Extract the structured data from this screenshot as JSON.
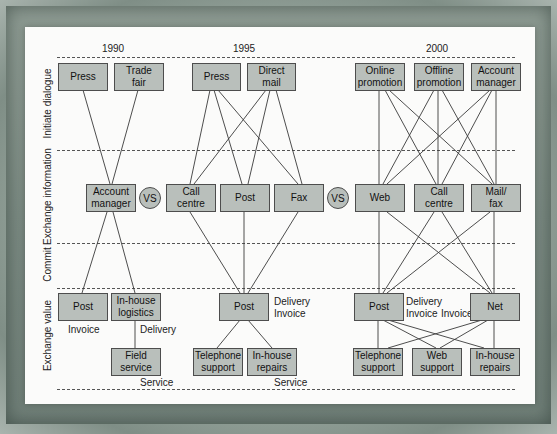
{
  "years": {
    "y1990": "1990",
    "y1995": "1995",
    "y2000": "2000"
  },
  "row_labels": {
    "initiate": "Initiate dialogue",
    "exchange_info": "Exchange information",
    "commit": "Commit",
    "exchange_value": "Exchange value"
  },
  "vs_label": "VS",
  "nodes": {
    "n1990_press": "Press",
    "n1990_trade_fair": "Trade\nfair",
    "n1990_account_manager": "Account\nmanager",
    "n1990_post": "Post",
    "n1990_inhouse_logistics": "In-house\nlogistics",
    "n1990_field_service": "Field\nservice",
    "n1995_press": "Press",
    "n1995_direct_mail": "Direct\nmail",
    "n1995_call_centre": "Call\ncentre",
    "n1995_post": "Post",
    "n1995_fax": "Fax",
    "n1995_post_value": "Post",
    "n1995_telephone_support": "Telephone\nsupport",
    "n1995_inhouse_repairs": "In-house\nrepairs",
    "n2000_online_promotion": "Online\npromotion",
    "n2000_offline_promotion": "Offline\npromotion",
    "n2000_account_manager": "Account\nmanager",
    "n2000_web": "Web",
    "n2000_call_centre": "Call\ncentre",
    "n2000_mail_fax": "Mail/\nfax",
    "n2000_post": "Post",
    "n2000_net": "Net",
    "n2000_telephone_support": "Telephone\nsupport",
    "n2000_web_support": "Web\nsupport",
    "n2000_inhouse_repairs": "In-house\nrepairs"
  },
  "notes": {
    "n1990_invoice": "Invoice",
    "n1990_delivery": "Delivery",
    "n1990_service": "Service",
    "n1995_delivery_invoice": "Delivery\nInvoice",
    "n1995_service": "Service",
    "n2000_delivery_invoice": "Delivery\nInvoice",
    "n2000_invoice": "Invoice"
  },
  "edges": [
    [
      "n1990_press",
      "n1990_account_manager"
    ],
    [
      "n1990_trade_fair",
      "n1990_account_manager"
    ],
    [
      "n1990_account_manager",
      "n1990_post"
    ],
    [
      "n1990_account_manager",
      "n1990_inhouse_logistics"
    ],
    [
      "n1990_inhouse_logistics",
      "n1990_field_service"
    ],
    [
      "n1995_press",
      "n1995_call_centre"
    ],
    [
      "n1995_press",
      "n1995_post"
    ],
    [
      "n1995_press",
      "n1995_fax"
    ],
    [
      "n1995_direct_mail",
      "n1995_call_centre"
    ],
    [
      "n1995_direct_mail",
      "n1995_post"
    ],
    [
      "n1995_direct_mail",
      "n1995_fax"
    ],
    [
      "n1995_call_centre",
      "n1995_post_value"
    ],
    [
      "n1995_post",
      "n1995_post_value"
    ],
    [
      "n1995_fax",
      "n1995_post_value"
    ],
    [
      "n1995_post_value",
      "n1995_telephone_support"
    ],
    [
      "n1995_post_value",
      "n1995_inhouse_repairs"
    ],
    [
      "n2000_online_promotion",
      "n2000_web"
    ],
    [
      "n2000_online_promotion",
      "n2000_call_centre"
    ],
    [
      "n2000_online_promotion",
      "n2000_mail_fax"
    ],
    [
      "n2000_offline_promotion",
      "n2000_web"
    ],
    [
      "n2000_offline_promotion",
      "n2000_call_centre"
    ],
    [
      "n2000_offline_promotion",
      "n2000_mail_fax"
    ],
    [
      "n2000_account_manager",
      "n2000_web"
    ],
    [
      "n2000_account_manager",
      "n2000_call_centre"
    ],
    [
      "n2000_account_manager",
      "n2000_mail_fax"
    ],
    [
      "n2000_web",
      "n2000_post"
    ],
    [
      "n2000_web",
      "n2000_net"
    ],
    [
      "n2000_call_centre",
      "n2000_post"
    ],
    [
      "n2000_call_centre",
      "n2000_net"
    ],
    [
      "n2000_mail_fax",
      "n2000_post"
    ],
    [
      "n2000_mail_fax",
      "n2000_net"
    ],
    [
      "n2000_post",
      "n2000_telephone_support"
    ],
    [
      "n2000_post",
      "n2000_web_support"
    ],
    [
      "n2000_post",
      "n2000_inhouse_repairs"
    ],
    [
      "n2000_net",
      "n2000_telephone_support"
    ],
    [
      "n2000_net",
      "n2000_web_support"
    ],
    [
      "n2000_net",
      "n2000_inhouse_repairs"
    ]
  ],
  "colors": {
    "box_fill": "#b9bfbb",
    "box_border": "#4d4d4d",
    "panel": "#fbfbfa",
    "frame": "#7f8e86"
  }
}
